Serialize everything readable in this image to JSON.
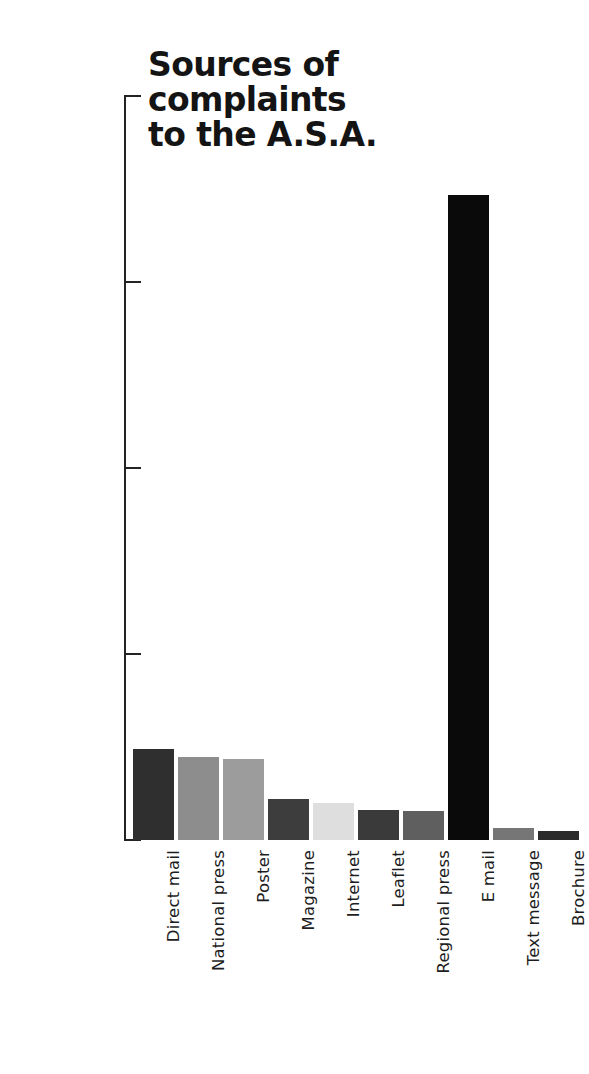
{
  "chart_data": {
    "type": "bar",
    "title": "Sources of\ncomplaints\nto the A.S.A.",
    "xlabel": "",
    "ylabel": "",
    "ylim": [
      0,
      20000
    ],
    "grid": false,
    "legend": "none",
    "yticks": [
      "0",
      "5000",
      "10000",
      "15000",
      "20000"
    ],
    "ytick_values": [
      0,
      5000,
      10000,
      15000,
      20000
    ],
    "categories": [
      "Direct mail",
      "National press",
      "Poster",
      "Magazine",
      "Internet",
      "Leaflet",
      "Regional press",
      "E mail",
      "Text message",
      "Brochure"
    ],
    "values": [
      2450,
      2230,
      2180,
      1100,
      1000,
      800,
      780,
      17350,
      320,
      240
    ],
    "bar_colors": [
      "#2f2f2f",
      "#8d8d8d",
      "#9c9c9c",
      "#3d3d3d",
      "#dedede",
      "#3a3a3a",
      "#5f5f5f",
      "#0a0a0a",
      "#767676",
      "#2b2b2b"
    ],
    "axis_color": "#232323",
    "background_color": "#ffffff",
    "title_color": "#141414"
  }
}
